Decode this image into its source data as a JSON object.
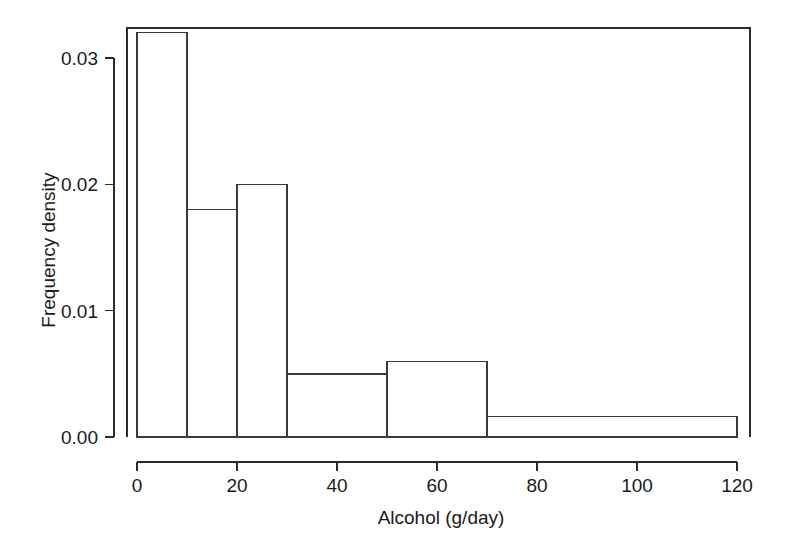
{
  "chart_data": {
    "type": "bar",
    "title": "",
    "subtitle": "",
    "xlabel": "Alcohol (g/day)",
    "ylabel": "Frequency density",
    "xlim": [
      0,
      120
    ],
    "ylim": [
      0.0,
      0.0335
    ],
    "grid": false,
    "legend": "none",
    "bin_edges": [
      0,
      10,
      20,
      30,
      50,
      70,
      120
    ],
    "categories": [
      "0-10",
      "10-20",
      "20-30",
      "30-50",
      "50-70",
      "70-120"
    ],
    "values": [
      0.032,
      0.018,
      0.02,
      0.005,
      0.006,
      0.0016
    ],
    "bars": [
      {
        "label": "0-10",
        "x_start": 0,
        "x_end": 10,
        "density": 0.032
      },
      {
        "label": "10-20",
        "x_start": 10,
        "x_end": 20,
        "density": 0.018
      },
      {
        "label": "20-30",
        "x_start": 20,
        "x_end": 30,
        "density": 0.02
      },
      {
        "label": "30-50",
        "x_start": 30,
        "x_end": 50,
        "density": 0.005
      },
      {
        "label": "50-70",
        "x_start": 50,
        "x_end": 70,
        "density": 0.006
      },
      {
        "label": "70-120",
        "x_start": 70,
        "x_end": 120,
        "density": 0.0016
      }
    ],
    "x_ticks": [
      {
        "value": 0,
        "label": "0"
      },
      {
        "value": 20,
        "label": "20"
      },
      {
        "value": 40,
        "label": "40"
      },
      {
        "value": 60,
        "label": "60"
      },
      {
        "value": 80,
        "label": "80"
      },
      {
        "value": 100,
        "label": "100"
      },
      {
        "value": 120,
        "label": "120"
      }
    ],
    "y_ticks": [
      {
        "value": 0.0,
        "label": "0.00"
      },
      {
        "value": 0.01,
        "label": "0.01"
      },
      {
        "value": 0.02,
        "label": "0.02"
      },
      {
        "value": 0.03,
        "label": "0.03"
      }
    ],
    "colors": {
      "background": "#ffffff",
      "bar_fill": "none",
      "bar_stroke": "#3a3a3a",
      "axis": "#2b2b2b",
      "text": "#1a1a1a"
    }
  }
}
